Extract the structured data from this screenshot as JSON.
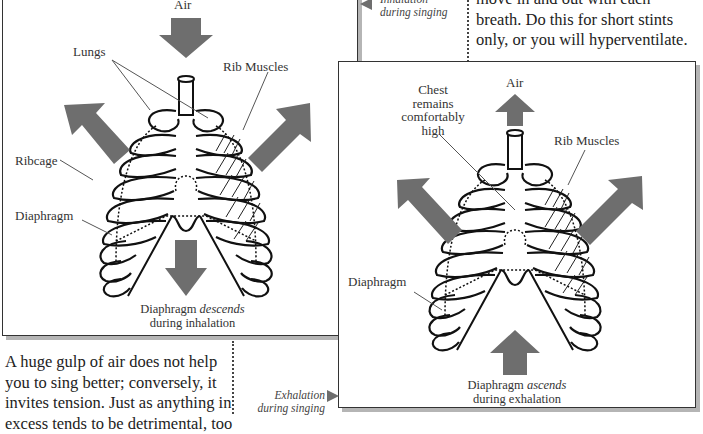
{
  "top_right_text": {
    "lines": [
      "move in and out with each",
      "breath.  Do this for short stints",
      "only, or you will hyperventilate."
    ]
  },
  "inhalation_note": {
    "line1": "Inhalation",
    "line2": "during singing",
    "arrow": "left-triangle-icon"
  },
  "exhalation_note": {
    "line1": "Exhalation",
    "line2": "during singing",
    "arrow": "right-triangle-icon"
  },
  "inhalation_figure": {
    "labels": {
      "air": "Air",
      "lungs": "Lungs",
      "rib_muscles": "Rib Muscles",
      "ribcage": "Ribcage",
      "diaphragm": "Diaphragm"
    },
    "caption": {
      "prefix": "Diaphragm ",
      "emph": "descends",
      "line2": "during inhalation"
    },
    "arrows": [
      "air-down-arrow-icon",
      "ribcage-expand-left-arrow-icon",
      "ribcage-expand-right-arrow-icon",
      "diaphragm-down-arrow-icon"
    ]
  },
  "exhalation_figure": {
    "labels": {
      "air": "Air",
      "chest": "Chest remains comfortably high",
      "chest_lines": [
        "Chest",
        "remains",
        "comfortably",
        "high"
      ],
      "rib_muscles": "Rib Muscles",
      "diaphragm": "Diaphragm"
    },
    "caption": {
      "prefix": "Diaphragm ",
      "emph": "ascends",
      "line2": "during exhalation"
    },
    "arrows": [
      "air-up-arrow-icon",
      "ribcage-left-arrow-icon",
      "ribcage-right-arrow-icon",
      "diaphragm-up-arrow-icon"
    ]
  },
  "bottom_left_text": {
    "lines": [
      "A huge gulp of air does not help",
      "you to sing better; conversely, it",
      "invites tension.  Just as anything in",
      "excess tends to be detrimental, too"
    ]
  },
  "colors": {
    "arrow": "#6e6e6e",
    "frame_border": "#333333",
    "shadow": "#b5b5b5"
  }
}
